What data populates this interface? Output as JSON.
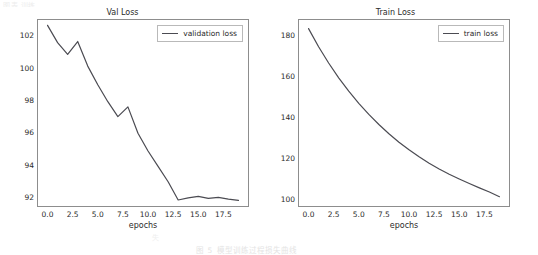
{
  "figure": {
    "background": "#ffffff",
    "line_color": "#4b4b52",
    "spine_color": "#8d8d8d",
    "text_color": "#2b2b2b"
  },
  "fragments": {
    "top": "图表 训练",
    "bottom": "失",
    "bottom2": "图 5  模型训练过程损失曲线"
  },
  "chart_data": [
    {
      "type": "line",
      "title": "Val Loss",
      "xlabel": "epochs",
      "ylabel": "",
      "legend": [
        "validation loss"
      ],
      "legend_position": "upper right",
      "grid": false,
      "xlim": [
        -0.95,
        19.95
      ],
      "ylim": [
        91.45,
        102.95
      ],
      "xticks": [
        "0.0",
        "2.5",
        "5.0",
        "7.5",
        "10.0",
        "12.5",
        "15.0",
        "17.5"
      ],
      "xtick_values": [
        0.0,
        2.5,
        5.0,
        7.5,
        10.0,
        12.5,
        15.0,
        17.5
      ],
      "yticks": [
        "92",
        "94",
        "96",
        "98",
        "100",
        "102"
      ],
      "ytick_values": [
        92,
        94,
        96,
        98,
        100,
        102
      ],
      "x": [
        0,
        1,
        2,
        3,
        4,
        5,
        6,
        7,
        8,
        9,
        10,
        11,
        12,
        13,
        14,
        15,
        16,
        17,
        18,
        19
      ],
      "series": [
        {
          "name": "validation loss",
          "values": [
            102.62,
            101.55,
            100.82,
            101.62,
            100.1,
            98.95,
            97.9,
            96.98,
            97.58,
            95.95,
            94.85,
            93.9,
            92.95,
            91.82,
            91.95,
            92.05,
            91.92,
            91.98,
            91.88,
            91.8
          ]
        }
      ]
    },
    {
      "type": "line",
      "title": "Train Loss",
      "xlabel": "epochs",
      "ylabel": "",
      "legend": [
        "train loss"
      ],
      "legend_position": "upper right",
      "grid": false,
      "xlim": [
        -0.95,
        19.95
      ],
      "ylim": [
        96.8,
        187.2
      ],
      "xticks": [
        "0.0",
        "2.5",
        "5.0",
        "7.5",
        "10.0",
        "12.5",
        "15.0",
        "17.5"
      ],
      "xtick_values": [
        0.0,
        2.5,
        5.0,
        7.5,
        10.0,
        12.5,
        15.0,
        17.5
      ],
      "yticks": [
        "100",
        "120",
        "140",
        "160",
        "180"
      ],
      "ytick_values": [
        100,
        120,
        140,
        160,
        180
      ],
      "x": [
        0,
        1,
        2,
        3,
        4,
        5,
        6,
        7,
        8,
        9,
        10,
        11,
        12,
        13,
        14,
        15,
        16,
        17,
        18,
        19
      ],
      "series": [
        {
          "name": "train loss",
          "values": [
            183.0,
            174.2,
            166.3,
            159.1,
            152.6,
            146.7,
            141.3,
            136.4,
            131.9,
            127.8,
            124.1,
            120.7,
            117.6,
            114.8,
            112.2,
            109.9,
            107.7,
            105.6,
            103.6,
            101.3
          ]
        }
      ]
    }
  ]
}
